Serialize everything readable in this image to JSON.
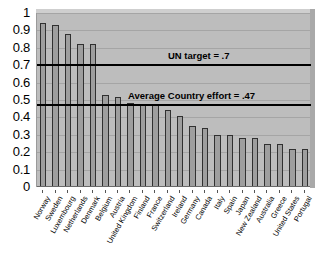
{
  "chart_data": {
    "type": "bar",
    "title": "",
    "subtitle": "",
    "xlabel": "",
    "ylabel": "",
    "ylim": [
      0,
      1
    ],
    "ytick_step": 0.1,
    "grid": true,
    "legend": "none",
    "orientation": "vertical",
    "bar_color": "#9e9e9e",
    "plot_background": "#bdbdbd",
    "categories": [
      "Norway",
      "Sweden",
      "Luxembourg",
      "Netherlands",
      "Denmark",
      "Belgium",
      "Austria",
      "United Kingdom",
      "Finland",
      "France",
      "Switzerland",
      "Ireland",
      "Germany",
      "Canada",
      "Italy",
      "Spain",
      "Japan",
      "New Zealand",
      "Australia",
      "Greece",
      "United States",
      "Portugal"
    ],
    "values": [
      0.94,
      0.93,
      0.88,
      0.82,
      0.82,
      0.53,
      0.52,
      0.48,
      0.47,
      0.47,
      0.44,
      0.41,
      0.35,
      0.34,
      0.3,
      0.3,
      0.28,
      0.28,
      0.25,
      0.25,
      0.22,
      0.22
    ],
    "ytick_labels": [
      "1",
      "0.9",
      "0.8",
      "0.7",
      "0.6",
      "0.5",
      "0.4",
      "0.3",
      "0.2",
      "0.1",
      "0"
    ],
    "ytick_values": [
      1,
      0.9,
      0.8,
      0.7,
      0.6,
      0.5,
      0.4,
      0.3,
      0.2,
      0.1,
      0
    ],
    "reference_lines": [
      {
        "label": "UN target = .7",
        "value": 0.7
      },
      {
        "label": "Average Country effort = .47",
        "value": 0.47
      }
    ]
  }
}
